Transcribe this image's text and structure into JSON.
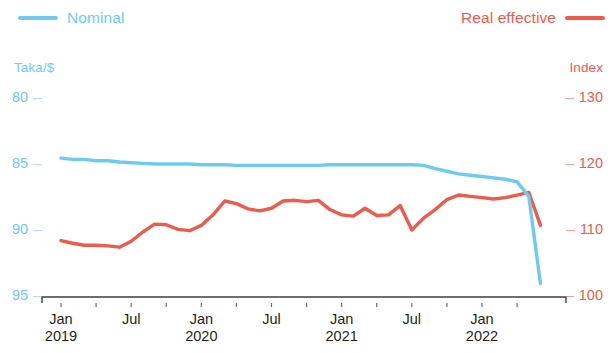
{
  "legend": {
    "nominal": {
      "label": "Nominal",
      "color": "#6ECBF0"
    },
    "real_effective": {
      "label": "Real effective",
      "color": "#EC5B4B"
    }
  },
  "axes": {
    "left_title": "Taka/$",
    "right_title": "Index",
    "left_ticks": [
      "80",
      "85",
      "90",
      "95"
    ],
    "right_ticks": [
      "130",
      "120",
      "110",
      "100"
    ],
    "x_ticks": [
      {
        "month": "Jan",
        "year": "2019"
      },
      {
        "month": "Jul",
        "year": ""
      },
      {
        "month": "Jan",
        "year": "2020"
      },
      {
        "month": "Jul",
        "year": ""
      },
      {
        "month": "Jan",
        "year": "2021"
      },
      {
        "month": "Jul",
        "year": ""
      },
      {
        "month": "Jan",
        "year": "2022"
      }
    ]
  },
  "chart_data": {
    "type": "line",
    "title": "",
    "xlabel": "",
    "ylabel": "Taka/$",
    "y2label": "Index",
    "grid": false,
    "legend_position": "top",
    "axis_inverted_left": true,
    "ylim": [
      80,
      95
    ],
    "y2lim": [
      100,
      130
    ],
    "xlim": [
      "2019-01",
      "2022-07"
    ],
    "x": [
      "2019-01",
      "2019-02",
      "2019-03",
      "2019-04",
      "2019-05",
      "2019-06",
      "2019-07",
      "2019-08",
      "2019-09",
      "2019-10",
      "2019-11",
      "2019-12",
      "2020-01",
      "2020-02",
      "2020-03",
      "2020-04",
      "2020-05",
      "2020-06",
      "2020-07",
      "2020-08",
      "2020-09",
      "2020-10",
      "2020-11",
      "2020-12",
      "2021-01",
      "2021-02",
      "2021-03",
      "2021-04",
      "2021-05",
      "2021-06",
      "2021-07",
      "2021-08",
      "2021-09",
      "2021-10",
      "2021-11",
      "2021-12",
      "2022-01",
      "2022-02",
      "2022-03",
      "2022-04",
      "2022-05",
      "2022-06"
    ],
    "series": [
      {
        "name": "Nominal",
        "axis": "left",
        "unit": "Taka/$",
        "color": "#6ECBF0",
        "values": [
          84.4,
          84.5,
          84.5,
          84.6,
          84.6,
          84.7,
          84.75,
          84.8,
          84.85,
          84.85,
          84.85,
          84.85,
          84.9,
          84.9,
          84.9,
          84.95,
          84.95,
          84.95,
          84.95,
          84.95,
          84.95,
          84.95,
          84.95,
          84.9,
          84.9,
          84.9,
          84.9,
          84.9,
          84.9,
          84.9,
          84.9,
          84.95,
          85.2,
          85.4,
          85.6,
          85.7,
          85.8,
          85.9,
          86.0,
          86.2,
          87.3,
          93.9
        ]
      },
      {
        "name": "Real effective",
        "axis": "right",
        "unit": "Index",
        "color": "#EC5B4B",
        "values": [
          108.7,
          108.3,
          108.0,
          108.0,
          107.9,
          107.7,
          108.6,
          110.0,
          111.2,
          111.1,
          110.4,
          110.2,
          111.0,
          112.6,
          114.7,
          114.3,
          113.5,
          113.2,
          113.6,
          114.7,
          114.8,
          114.6,
          114.8,
          113.4,
          112.6,
          112.4,
          113.6,
          112.5,
          112.6,
          114.0,
          110.3,
          112.1,
          113.4,
          114.9,
          115.6,
          115.4,
          115.2,
          115.0,
          115.2,
          115.6,
          116.0,
          111.0
        ]
      }
    ]
  }
}
